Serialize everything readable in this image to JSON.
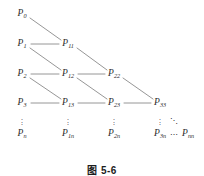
{
  "figure": {
    "caption": "图 5-6",
    "caption_y": 162,
    "background_color": "#ffffff",
    "edge_color": "#8a8a8a",
    "text_color": "#2b2b2b",
    "nodes": [
      {
        "name": "node-p0",
        "base": "P",
        "sub": "0",
        "x": 22,
        "y": 14
      },
      {
        "name": "node-p1",
        "base": "P",
        "sub": "1",
        "x": 22,
        "y": 44
      },
      {
        "name": "node-p11",
        "base": "P",
        "sub": "11",
        "x": 68,
        "y": 44
      },
      {
        "name": "node-p2",
        "base": "P",
        "sub": "2",
        "x": 22,
        "y": 74
      },
      {
        "name": "node-p12",
        "base": "P",
        "sub": "12",
        "x": 68,
        "y": 74
      },
      {
        "name": "node-p22",
        "base": "P",
        "sub": "22",
        "x": 114,
        "y": 74
      },
      {
        "name": "node-p3",
        "base": "P",
        "sub": "3",
        "x": 22,
        "y": 103
      },
      {
        "name": "node-p13",
        "base": "P",
        "sub": "13",
        "x": 68,
        "y": 103
      },
      {
        "name": "node-p23",
        "base": "P",
        "sub": "23",
        "x": 114,
        "y": 103
      },
      {
        "name": "node-p33",
        "base": "P",
        "sub": "33",
        "x": 160,
        "y": 103
      },
      {
        "name": "node-pn",
        "base": "P",
        "sub": "n",
        "x": 22,
        "y": 134
      },
      {
        "name": "node-p1n",
        "base": "P",
        "sub": "1n",
        "x": 68,
        "y": 134
      },
      {
        "name": "node-p2n",
        "base": "P",
        "sub": "2n",
        "x": 114,
        "y": 134
      },
      {
        "name": "node-p3n",
        "base": "P",
        "sub": "3n",
        "x": 160,
        "y": 134
      },
      {
        "name": "node-pnn",
        "base": "P",
        "sub": "nn",
        "x": 188,
        "y": 134
      }
    ],
    "vertical_ellipses": [
      {
        "name": "vdots-col-0",
        "glyph": "⋮",
        "x": 22,
        "y": 121
      },
      {
        "name": "vdots-col-1",
        "glyph": "⋮",
        "x": 68,
        "y": 121
      },
      {
        "name": "vdots-col-2",
        "glyph": "⋮",
        "x": 114,
        "y": 121
      },
      {
        "name": "vdots-col-3",
        "glyph": "⋮",
        "x": 160,
        "y": 121
      }
    ],
    "horizontal_ellipsis": {
      "name": "hdots-bottom-row",
      "glyph": "⋯",
      "x": 174,
      "y": 135
    },
    "diagonal_ellipsis": {
      "name": "ddots-corner",
      "glyph": "⋱",
      "x": 174,
      "y": 121
    },
    "edges": [
      {
        "name": "edge-p0-p11",
        "x1": 30,
        "y1": 18,
        "x2": 61,
        "y2": 40,
        "kind": "diagonal"
      },
      {
        "name": "edge-p1-p11",
        "x1": 31,
        "y1": 44,
        "x2": 59,
        "y2": 44,
        "kind": "horizontal"
      },
      {
        "name": "edge-p1-p12",
        "x1": 30,
        "y1": 48,
        "x2": 61,
        "y2": 70,
        "kind": "diagonal"
      },
      {
        "name": "edge-p11-p22",
        "x1": 77,
        "y1": 48,
        "x2": 107,
        "y2": 70,
        "kind": "diagonal"
      },
      {
        "name": "edge-p2-p12",
        "x1": 31,
        "y1": 74,
        "x2": 59,
        "y2": 74,
        "kind": "horizontal"
      },
      {
        "name": "edge-p12-p22",
        "x1": 78,
        "y1": 74,
        "x2": 105,
        "y2": 74,
        "kind": "horizontal"
      },
      {
        "name": "edge-p2-p13",
        "x1": 30,
        "y1": 78,
        "x2": 61,
        "y2": 99,
        "kind": "diagonal"
      },
      {
        "name": "edge-p12-p23",
        "x1": 77,
        "y1": 78,
        "x2": 107,
        "y2": 99,
        "kind": "diagonal"
      },
      {
        "name": "edge-p22-p33",
        "x1": 123,
        "y1": 78,
        "x2": 153,
        "y2": 99,
        "kind": "diagonal"
      },
      {
        "name": "edge-p3-p13",
        "x1": 31,
        "y1": 103,
        "x2": 59,
        "y2": 103,
        "kind": "horizontal"
      },
      {
        "name": "edge-p13-p23",
        "x1": 78,
        "y1": 103,
        "x2": 105,
        "y2": 103,
        "kind": "horizontal"
      },
      {
        "name": "edge-p23-p33",
        "x1": 124,
        "y1": 103,
        "x2": 151,
        "y2": 103,
        "kind": "horizontal"
      }
    ]
  }
}
